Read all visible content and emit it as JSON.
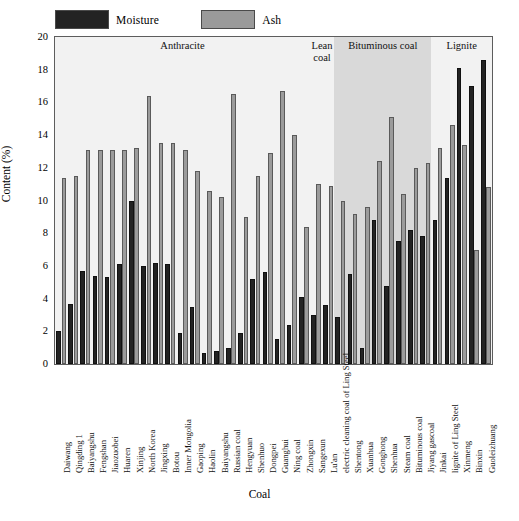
{
  "legend": {
    "items": [
      {
        "label": "Moisture",
        "color": "#232323",
        "key": "moisture"
      },
      {
        "label": "Ash",
        "color": "#9b9b9b",
        "key": "ash"
      }
    ]
  },
  "axes": {
    "ylabel": "Content (%)",
    "xlabel": "Coal",
    "yticks": [
      "0",
      "2",
      "4",
      "6",
      "8",
      "10",
      "12",
      "14",
      "16",
      "18",
      "20"
    ]
  },
  "groups": [
    {
      "label": "Anthracite",
      "start": 0,
      "end": 21,
      "shade": "light"
    },
    {
      "label": "Lean coal",
      "start": 21,
      "end": 23,
      "shade": "light"
    },
    {
      "label": "Bituminous coal",
      "start": 23,
      "end": 31,
      "shade": "dark"
    },
    {
      "label": "Lignite",
      "start": 31,
      "end": 36,
      "shade": "light"
    }
  ],
  "chart_data": {
    "type": "bar",
    "title": "",
    "xlabel": "Coal",
    "ylabel": "Content (%)",
    "ylim": [
      0,
      20
    ],
    "ytick_step": 2,
    "grid": false,
    "legend_position": "top-left",
    "categories": [
      "Daiwang",
      "Qingding 1",
      "Baiyangshu",
      "Fengshan",
      "Jiaozuobei",
      "Huaren",
      "Xinjing",
      "North Korea",
      "Jingxing",
      "Botou",
      "Inner Mongolia",
      "Gaoping",
      "Haolin",
      "Baiyangshu",
      "Russian coal",
      "Hengyuan",
      "Shenhuo",
      "Dongpei",
      "Guanghui",
      "Ning coal",
      "Zhongxin",
      "Sangexun",
      "Lu'an",
      "electric cleaning coal of Ling Steel",
      "Shentong",
      "Xuanhua",
      "Gonghong",
      "Shenhua",
      "Steam coal",
      "Bituminous coal",
      "Jiyang gascoal",
      "Jinkai",
      "lignite of Ling Steel",
      "Xinmeng",
      "Binxin",
      "Guoleizhuang"
    ],
    "series": [
      {
        "name": "Moisture",
        "color": "#232323",
        "values": [
          2.0,
          3.7,
          5.7,
          5.4,
          5.3,
          6.1,
          10.0,
          6.0,
          6.2,
          6.1,
          1.9,
          3.5,
          0.7,
          0.8,
          1.0,
          1.9,
          5.2,
          5.6,
          1.5,
          2.4,
          4.1,
          3.0,
          3.6,
          2.9,
          5.5,
          1.0,
          8.8,
          4.8,
          7.5,
          8.2,
          7.8,
          8.8,
          11.4,
          18.1,
          17.0,
          18.6
        ]
      },
      {
        "name": "Ash",
        "color": "#9b9b9b",
        "values": [
          11.4,
          11.5,
          13.1,
          13.1,
          13.1,
          13.1,
          13.2,
          16.4,
          13.5,
          13.5,
          13.1,
          11.8,
          10.6,
          10.2,
          16.5,
          9.0,
          11.5,
          12.9,
          16.7,
          14.0,
          8.4,
          11.0,
          10.9,
          10.0,
          9.2,
          9.6,
          12.4,
          15.1,
          10.4,
          12.0,
          12.3,
          13.2,
          14.6,
          13.4,
          7.0,
          10.8
        ]
      }
    ]
  }
}
